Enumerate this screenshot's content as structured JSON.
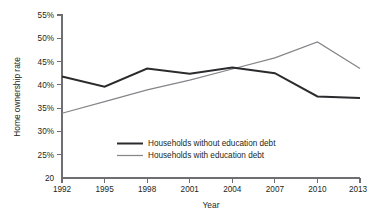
{
  "chart_data": {
    "type": "line",
    "title": "",
    "xlabel": "Year",
    "ylabel": "Home ownership rate",
    "categories": [
      "1992",
      "1995",
      "1998",
      "2001",
      "2004",
      "2007",
      "2010",
      "2013"
    ],
    "x": [
      1992,
      1995,
      1998,
      2001,
      2004,
      2007,
      2010,
      2013
    ],
    "xlim": [
      1992,
      2013
    ],
    "ylim": [
      20,
      55
    ],
    "ytick_labels": [
      "55%",
      "50%",
      "45%",
      "40%",
      "35%",
      "30%",
      "25%",
      "20"
    ],
    "ytick_values": [
      55,
      50,
      45,
      40,
      35,
      30,
      25,
      20
    ],
    "xtick_labels": [
      "1992",
      "1995",
      "1998",
      "2001",
      "2004",
      "2007",
      "2010",
      "2013"
    ],
    "grid": false,
    "legend_position": "inside-lower-center",
    "series": [
      {
        "name": "Households without education debt",
        "color": "#2b2b2e",
        "values": [
          41.8,
          39.6,
          43.5,
          42.4,
          43.7,
          42.5,
          37.5,
          37.2
        ]
      },
      {
        "name": "Households with education debt",
        "color": "#85858a",
        "values": [
          33.9,
          36.4,
          38.9,
          41.0,
          43.4,
          45.8,
          49.2,
          43.5
        ]
      }
    ]
  },
  "axes": {
    "y_title": "Home ownership rate",
    "x_title": "Year"
  },
  "legend": {
    "items": [
      {
        "label": "Households without education debt"
      },
      {
        "label": "Households with education debt"
      }
    ]
  },
  "caption": {
    "text": ""
  }
}
